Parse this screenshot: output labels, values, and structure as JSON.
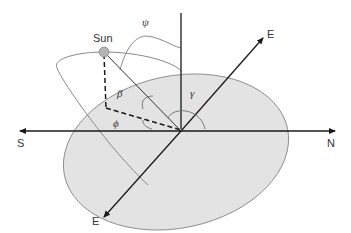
{
  "diagram": {
    "labels": {
      "sun": "Sun",
      "psi": "ψ",
      "beta": "β",
      "gamma": "γ",
      "phi": "ϕ",
      "south": "S",
      "north": "N",
      "east_top": "E",
      "east_bottom": "E"
    },
    "colors": {
      "ground_fill": "#e3e3e3",
      "ground_stroke": "#8a8a8a",
      "axis": "#1a1a1a",
      "orbit": "#8a8a8a",
      "sun_fill": "#b5b5b5",
      "text": "#333333"
    }
  }
}
